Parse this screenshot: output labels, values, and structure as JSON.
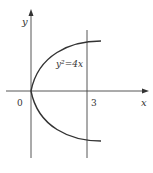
{
  "diagram": {
    "equation": "y²=4x",
    "x_axis_label": "x",
    "y_axis_label": "y",
    "origin_label": "0",
    "vertical_line_label": "3",
    "colors": {
      "stroke": "#333333",
      "background": "#ffffff"
    }
  }
}
